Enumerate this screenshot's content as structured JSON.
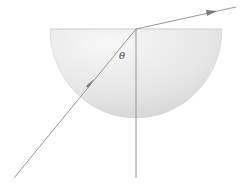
{
  "diagram": {
    "angle_label": "θ",
    "colors": {
      "block_fill_light": "#f4f4f4",
      "block_fill_dark": "#d6d6d6",
      "ray": "#8a8a8a",
      "normal": "#8a8a8a",
      "label": "#444444"
    },
    "elements": [
      {
        "name": "semicircular-block",
        "type": "half-disc",
        "flat_side": "top"
      },
      {
        "name": "incident-ray",
        "direction": "from lower-left toward center of flat face",
        "arrow": true
      },
      {
        "name": "normal-line",
        "orientation": "vertical",
        "through": "center of flat face"
      },
      {
        "name": "refracted-ray",
        "direction": "from center of flat face toward upper-right",
        "arrow": true
      },
      {
        "name": "angle-theta",
        "between": "incident ray and normal"
      }
    ]
  }
}
